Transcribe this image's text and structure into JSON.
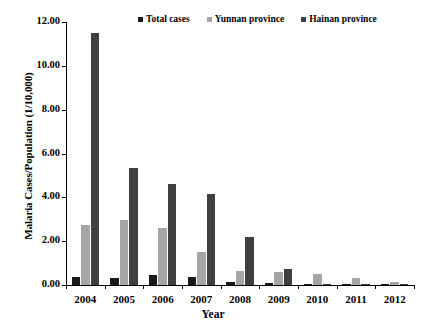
{
  "chart_data": {
    "type": "bar",
    "title": "",
    "xlabel": "Year",
    "ylabel": "Malaria Cases/Population (1/10,000)",
    "categories": [
      "2004",
      "2005",
      "2006",
      "2007",
      "2008",
      "2009",
      "2010",
      "2011",
      "2012"
    ],
    "ylim": [
      0,
      12
    ],
    "ytick_values": [
      0,
      2,
      4,
      6,
      8,
      10,
      12
    ],
    "ytick_labels": [
      "0.00",
      "2.00",
      "4.00",
      "6.00",
      "8.00",
      "10.00",
      "12.00"
    ],
    "grid": false,
    "legend_position": "top-center",
    "series": [
      {
        "name": "Total cases",
        "color": "#1a1a1a",
        "values": [
          0.35,
          0.33,
          0.45,
          0.38,
          0.12,
          0.09,
          0.05,
          0.03,
          0.02
        ]
      },
      {
        "name": "Yunnan province",
        "color": "#a6a6a6",
        "values": [
          2.75,
          2.95,
          2.6,
          1.5,
          0.65,
          0.58,
          0.48,
          0.3,
          0.15
        ]
      },
      {
        "name": "Hainan province",
        "color": "#3f3f3f",
        "values": [
          11.5,
          5.35,
          4.6,
          4.15,
          2.2,
          0.75,
          0.05,
          0.02,
          0.01
        ]
      }
    ]
  }
}
